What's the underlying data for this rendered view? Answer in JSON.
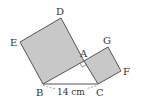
{
  "figure": {
    "colors": {
      "square_fill": "#c8c8c8",
      "stroke": "#555555",
      "background": "#ffffff"
    },
    "points": {
      "D": {
        "label": "D",
        "x": 61,
        "y": 18
      },
      "E": {
        "label": "E",
        "x": 20,
        "y": 42
      },
      "B": {
        "label": "B",
        "x": 43,
        "y": 84
      },
      "A": {
        "label": "A",
        "x": 84,
        "y": 61
      },
      "G": {
        "label": "G",
        "x": 108,
        "y": 47
      },
      "F": {
        "label": "F",
        "x": 121,
        "y": 71
      },
      "C": {
        "label": "C",
        "x": 98,
        "y": 84
      }
    },
    "labels": {
      "D": "D",
      "E": "E",
      "A": "A",
      "G": "G",
      "F": "F",
      "B": "B",
      "C": "C"
    },
    "dimension": {
      "bc_length": "14 cm"
    }
  }
}
